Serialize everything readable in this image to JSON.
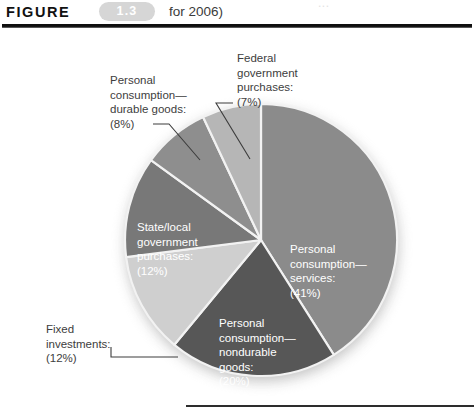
{
  "header": {
    "figure_word": "FIGURE",
    "figure_number": "1.3",
    "caption_fragment": "for 2006)",
    "ghost_fragment": "..."
  },
  "chart_data": {
    "type": "pie",
    "title": "",
    "legend_position": "inline-labels",
    "unit": "percent",
    "categories": [
      "Personal consumption—services",
      "Personal consumption—nondurable goods",
      "Fixed investments",
      "State/local government purchases",
      "Personal consumption—durable goods",
      "Federal government purchases"
    ],
    "values": [
      41,
      20,
      12,
      12,
      8,
      7
    ],
    "slices": [
      {
        "name": "personal-consumption-services",
        "label": "Personal\nconsumption—\nservices:\n(41%)",
        "value": 41,
        "percent_text": "(41%)",
        "color": "#8b8b8b",
        "label_style": "inside-white"
      },
      {
        "name": "personal-consumption-nondurable-goods",
        "label": "Personal\nconsumption—\nnondurable\ngoods:\n(20%)",
        "value": 20,
        "percent_text": "(20%)",
        "color": "#575757",
        "label_style": "inside-white"
      },
      {
        "name": "fixed-investments",
        "label": "Fixed\ninvestments:\n(12%)",
        "value": 12,
        "percent_text": "(12%)",
        "color": "#cfcfcf",
        "label_style": "outside-callout"
      },
      {
        "name": "state-local-government-purchases",
        "label": "State/local\ngovernment\npurchases:\n(12%)",
        "value": 12,
        "percent_text": "(12%)",
        "color": "#787878",
        "label_style": "inside-white"
      },
      {
        "name": "personal-consumption-durable-goods",
        "label": "Personal\nconsumption—\ndurable goods:\n(8%)",
        "value": 8,
        "percent_text": "(8%)",
        "color": "#8e8e8e",
        "label_style": "outside-callout"
      },
      {
        "name": "federal-government-purchases",
        "label": "Federal\ngovernment\npurchases:\n(7%)",
        "value": 7,
        "percent_text": "(7%)",
        "color": "#b6b6b6",
        "label_style": "outside-callout"
      }
    ],
    "colors": {
      "services": "#8b8b8b",
      "nondurable": "#575757",
      "fixed_investments": "#cfcfcf",
      "state_local": "#787878",
      "durable": "#8e8e8e",
      "federal": "#b6b6b6",
      "shadow": "#bdbdbd",
      "separator": "#f2f2f2",
      "text_dark": "#3d3d3d",
      "text_light": "#ffffff",
      "badge": "#d6d6d6",
      "rule": "#0f0f0f"
    }
  }
}
